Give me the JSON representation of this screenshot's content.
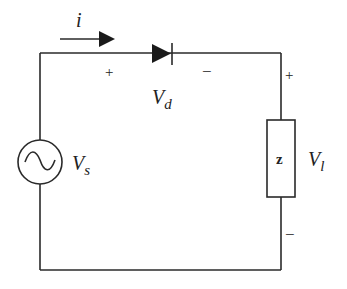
{
  "diagram": {
    "type": "circuit",
    "current": {
      "symbol": "i"
    },
    "source": {
      "symbol": "V",
      "subscript": "s"
    },
    "diode": {
      "voltage_symbol": "V",
      "voltage_subscript": "d",
      "plus": "+",
      "minus": "−"
    },
    "load": {
      "box_label": "z",
      "voltage_symbol": "V",
      "voltage_subscript": "l",
      "plus": "+",
      "minus": "−"
    },
    "colors": {
      "stroke": "#2a2a2a",
      "background": "#ffffff"
    }
  }
}
